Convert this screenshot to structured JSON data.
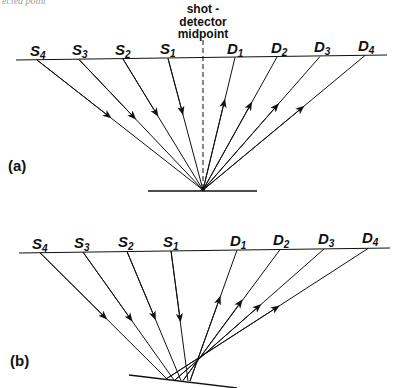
{
  "caption_fragment": "ected point",
  "midpoint_label": [
    "shot -",
    "detector",
    "midpoint"
  ],
  "panel_a": {
    "label": "(a)",
    "sources": [
      {
        "name": "S",
        "sub": "4"
      },
      {
        "name": "S",
        "sub": "3"
      },
      {
        "name": "S",
        "sub": "2"
      },
      {
        "name": "S",
        "sub": "1"
      }
    ],
    "detectors": [
      {
        "name": "D",
        "sub": "1"
      },
      {
        "name": "D",
        "sub": "2"
      },
      {
        "name": "D",
        "sub": "3"
      },
      {
        "name": "D",
        "sub": "4"
      }
    ],
    "reflector": "flat"
  },
  "panel_b": {
    "label": "(b)",
    "sources": [
      {
        "name": "S",
        "sub": "4"
      },
      {
        "name": "S",
        "sub": "3"
      },
      {
        "name": "S",
        "sub": "2"
      },
      {
        "name": "S",
        "sub": "1"
      }
    ],
    "detectors": [
      {
        "name": "D",
        "sub": "1"
      },
      {
        "name": "D",
        "sub": "2"
      },
      {
        "name": "D",
        "sub": "3"
      },
      {
        "name": "D",
        "sub": "4"
      }
    ],
    "reflector": "dipping"
  },
  "colors": {
    "ink": "#111111",
    "background": "#ffffff"
  }
}
